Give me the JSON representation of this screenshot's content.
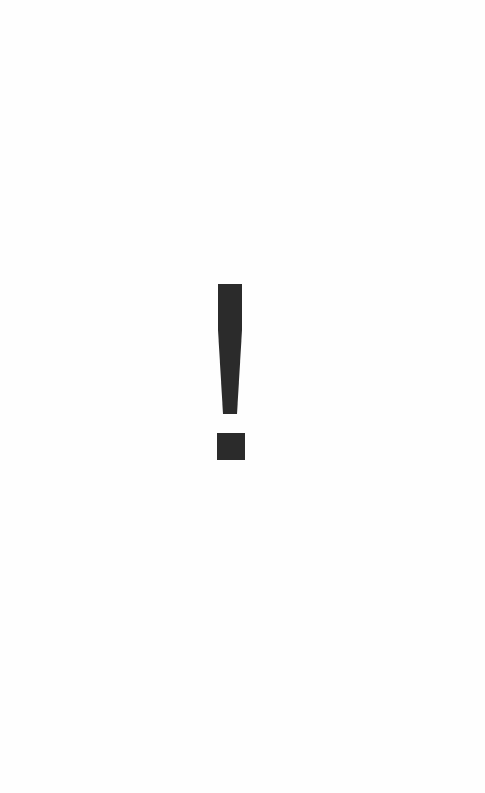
{
  "screen": {
    "background_color": "#fefefe"
  },
  "icon": {
    "name": "exclamation-mark-icon",
    "glyph": "!",
    "color": "#2b2b2b"
  }
}
